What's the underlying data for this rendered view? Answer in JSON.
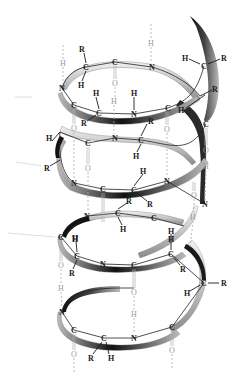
{
  "diagram": {
    "type": "alpha-helix-structure",
    "colors": {
      "ribbon_light": "#e6e6e6",
      "ribbon_mid": "#a0a0a0",
      "ribbon_dark": "#1a1a1a",
      "atom_text": "#1a1a1a",
      "hbond": "#a8a8a8"
    },
    "labels": {
      "N": "N",
      "C": "C",
      "H": "H",
      "O": "O",
      "R": "R"
    },
    "atoms": [
      {
        "id": "a1",
        "el": "H",
        "x": 63,
        "y": 63,
        "faint": true
      },
      {
        "id": "a2",
        "el": "R",
        "x": 82,
        "y": 49
      },
      {
        "id": "a3",
        "el": "C",
        "x": 86,
        "y": 67
      },
      {
        "id": "a4",
        "el": "H",
        "x": 81,
        "y": 85
      },
      {
        "id": "a5",
        "el": "C",
        "x": 115,
        "y": 62
      },
      {
        "id": "a6",
        "el": "O",
        "x": 115,
        "y": 83,
        "faint": true
      },
      {
        "id": "a7",
        "el": "H",
        "x": 151,
        "y": 43,
        "faint": true
      },
      {
        "id": "a8",
        "el": "N",
        "x": 152,
        "y": 67
      },
      {
        "id": "a9",
        "el": "H",
        "x": 185,
        "y": 58
      },
      {
        "id": "a10",
        "el": "C",
        "x": 204,
        "y": 66
      },
      {
        "id": "a11",
        "el": "R",
        "x": 224,
        "y": 58
      },
      {
        "id": "a12",
        "el": "N",
        "x": 62,
        "y": 88
      },
      {
        "id": "a13",
        "el": "C",
        "x": 74,
        "y": 105
      },
      {
        "id": "a14",
        "el": "H",
        "x": 96,
        "y": 93
      },
      {
        "id": "a15",
        "el": "C",
        "x": 99,
        "y": 113
      },
      {
        "id": "a16",
        "el": "R",
        "x": 84,
        "y": 123
      },
      {
        "id": "a17",
        "el": "H",
        "x": 114,
        "y": 101,
        "faint": true
      },
      {
        "id": "a18",
        "el": "H",
        "x": 134,
        "y": 93
      },
      {
        "id": "a19",
        "el": "N",
        "x": 134,
        "y": 114
      },
      {
        "id": "a20",
        "el": "R",
        "x": 151,
        "y": 121
      },
      {
        "id": "a21",
        "el": "C",
        "x": 168,
        "y": 108
      },
      {
        "id": "a22",
        "el": "H",
        "x": 181,
        "y": 110
      },
      {
        "id": "a23",
        "el": "R",
        "x": 215,
        "y": 89
      },
      {
        "id": "a24",
        "el": "C",
        "x": 206,
        "y": 124
      },
      {
        "id": "a25",
        "el": "O",
        "x": 74,
        "y": 128,
        "faint": true
      },
      {
        "id": "a26",
        "el": "O",
        "x": 167,
        "y": 129,
        "faint": true
      },
      {
        "id": "a27",
        "el": "H",
        "x": 49,
        "y": 138
      },
      {
        "id": "a28",
        "el": "C",
        "x": 88,
        "y": 143
      },
      {
        "id": "a29",
        "el": "N",
        "x": 115,
        "y": 138
      },
      {
        "id": "a30",
        "el": "C",
        "x": 141,
        "y": 140
      },
      {
        "id": "a31",
        "el": "H",
        "x": 136,
        "y": 156
      },
      {
        "id": "a32",
        "el": "R",
        "x": 47,
        "y": 168
      },
      {
        "id": "a33",
        "el": "O",
        "x": 88,
        "y": 168,
        "faint": true
      },
      {
        "id": "a34",
        "el": "O",
        "x": 206,
        "y": 150,
        "faint": true
      },
      {
        "id": "a35",
        "el": "H",
        "x": 206,
        "y": 166,
        "faint": true
      },
      {
        "id": "a36",
        "el": "N",
        "x": 74,
        "y": 183
      },
      {
        "id": "a37",
        "el": "H",
        "x": 143,
        "y": 171
      },
      {
        "id": "a38",
        "el": "N",
        "x": 167,
        "y": 181
      },
      {
        "id": "a39",
        "el": "C",
        "x": 103,
        "y": 189
      },
      {
        "id": "a40",
        "el": "C",
        "x": 134,
        "y": 190
      },
      {
        "id": "a41",
        "el": "R",
        "x": 129,
        "y": 201
      },
      {
        "id": "a42",
        "el": "R",
        "x": 150,
        "y": 204
      },
      {
        "id": "a43",
        "el": "O",
        "x": 194,
        "y": 195,
        "faint": true
      },
      {
        "id": "a44",
        "el": "N",
        "x": 205,
        "y": 204
      },
      {
        "id": "a45",
        "el": "N",
        "x": 87,
        "y": 216
      },
      {
        "id": "a46",
        "el": "C",
        "x": 118,
        "y": 213
      },
      {
        "id": "a47",
        "el": "H",
        "x": 123,
        "y": 229
      },
      {
        "id": "a48",
        "el": "C",
        "x": 154,
        "y": 218
      },
      {
        "id": "a49",
        "el": "H",
        "x": 193,
        "y": 217,
        "faint": true
      },
      {
        "id": "a50",
        "el": "C",
        "x": 61,
        "y": 237
      },
      {
        "id": "a51",
        "el": "H",
        "x": 75,
        "y": 238
      },
      {
        "id": "a52",
        "el": "H",
        "x": 171,
        "y": 231
      },
      {
        "id": "a53",
        "el": "H",
        "x": 75,
        "y": 239
      },
      {
        "id": "a54",
        "el": "C",
        "x": 77,
        "y": 256
      },
      {
        "id": "a55",
        "el": "R",
        "x": 72,
        "y": 273
      },
      {
        "id": "a56",
        "el": "N",
        "x": 103,
        "y": 264
      },
      {
        "id": "a57",
        "el": "C",
        "x": 134,
        "y": 265
      },
      {
        "id": "a58",
        "el": "H",
        "x": 171,
        "y": 239
      },
      {
        "id": "a59",
        "el": "C",
        "x": 171,
        "y": 254
      },
      {
        "id": "a60",
        "el": "R",
        "x": 183,
        "y": 269
      },
      {
        "id": "a61",
        "el": "O",
        "x": 61,
        "y": 265,
        "faint": true
      },
      {
        "id": "a62",
        "el": "H",
        "x": 61,
        "y": 288,
        "faint": true
      },
      {
        "id": "a63",
        "el": "O",
        "x": 134,
        "y": 292,
        "faint": true
      },
      {
        "id": "a64",
        "el": "C",
        "x": 204,
        "y": 283
      },
      {
        "id": "a65",
        "el": "R",
        "x": 224,
        "y": 283
      },
      {
        "id": "a66",
        "el": "H",
        "x": 187,
        "y": 293
      },
      {
        "id": "a67",
        "el": "N",
        "x": 62,
        "y": 312
      },
      {
        "id": "a68",
        "el": "H",
        "x": 134,
        "y": 314,
        "faint": true
      },
      {
        "id": "a69",
        "el": "C",
        "x": 74,
        "y": 330
      },
      {
        "id": "a70",
        "el": "C",
        "x": 104,
        "y": 338
      },
      {
        "id": "a71",
        "el": "N",
        "x": 134,
        "y": 338
      },
      {
        "id": "a72",
        "el": "C",
        "x": 172,
        "y": 327
      },
      {
        "id": "a73",
        "el": "O",
        "x": 74,
        "y": 354,
        "faint": true
      },
      {
        "id": "a74",
        "el": "R",
        "x": 91,
        "y": 358
      },
      {
        "id": "a75",
        "el": "H",
        "x": 111,
        "y": 358
      },
      {
        "id": "a76",
        "el": "O",
        "x": 172,
        "y": 350,
        "faint": true
      }
    ]
  }
}
